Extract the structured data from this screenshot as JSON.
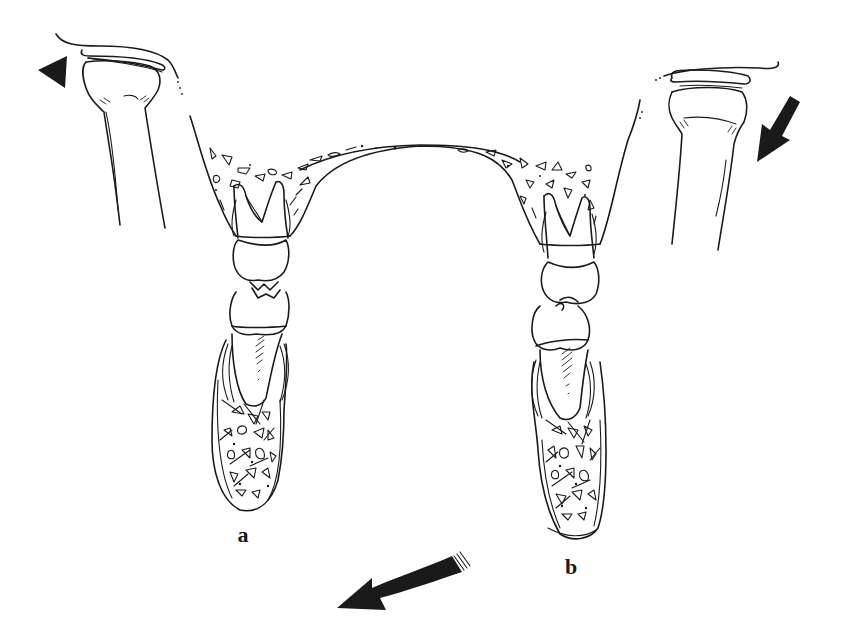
{
  "figure": {
    "labels": {
      "left": "a",
      "right": "b"
    },
    "arrows": [
      {
        "name": "left-condyle-arrow",
        "shape": "triangle",
        "direction": "left"
      },
      {
        "name": "right-condyle-arrow",
        "shape": "arrow",
        "direction": "down-left"
      },
      {
        "name": "mandible-shift-arrow",
        "shape": "curved-arrow",
        "direction": "left-down"
      }
    ],
    "colors": {
      "ink": "#1a1a1a",
      "background": "#ffffff"
    }
  }
}
